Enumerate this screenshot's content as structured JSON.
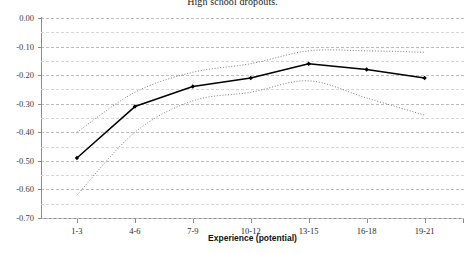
{
  "chart_data": {
    "type": "line",
    "title": "High school dropouts.",
    "xlabel": "Experience (potential)",
    "ylabel": "",
    "categories": [
      "1-3",
      "4-6",
      "7-9",
      "10-12",
      "13-15",
      "16-18",
      "19-21"
    ],
    "ylim": [
      -0.7,
      0.0
    ],
    "ytick_labels": [
      "0.00",
      "-0.10",
      "-0.20",
      "-0.30",
      "-0.40",
      "-0.50",
      "-0.60",
      "-0.70"
    ],
    "ytick_values": [
      0.0,
      -0.1,
      -0.2,
      -0.3,
      -0.4,
      -0.5,
      -0.6,
      -0.7
    ],
    "grid": true,
    "grid_minor_step": 0.05,
    "legend": "none",
    "series": [
      {
        "name": "Estimate",
        "style": "solid",
        "marker": "diamond",
        "color": "#000000",
        "values": [
          -0.49,
          -0.31,
          -0.24,
          -0.21,
          -0.16,
          -0.18,
          -0.21
        ]
      },
      {
        "name": "Upper confidence bound",
        "style": "dotted",
        "marker": "none",
        "color": "#6e6e6e",
        "values": [
          -0.4,
          -0.26,
          -0.19,
          -0.16,
          -0.115,
          -0.115,
          -0.12
        ]
      },
      {
        "name": "Lower confidence bound",
        "style": "dotted",
        "marker": "none",
        "color": "#6e6e6e",
        "values": [
          -0.62,
          -0.4,
          -0.29,
          -0.26,
          -0.22,
          -0.28,
          -0.34
        ]
      }
    ]
  }
}
